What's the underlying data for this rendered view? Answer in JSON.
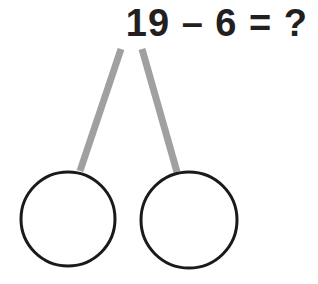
{
  "page": {
    "background_color": "#ffffff",
    "width": 318,
    "height": 284
  },
  "equation": {
    "text": "19 – 6 = ?",
    "minuend": "19",
    "operator": "–",
    "subtrahend": "6",
    "equals": "=",
    "result_placeholder": "?",
    "color": "#231f20"
  },
  "number_bond": {
    "branch_color": "#a0a0a0",
    "circle_stroke_color": "#1a1a1a",
    "circle_fill_color": "#ffffff",
    "circle_stroke_width": 3,
    "branch_width": 7,
    "apex": {
      "x": 130,
      "y": 48
    },
    "left_branch": {
      "x1": 121,
      "y1": 49,
      "x2": 80,
      "y2": 171
    },
    "right_branch": {
      "x1": 142,
      "y1": 49,
      "x2": 177,
      "y2": 172
    },
    "left_circle": {
      "cx": 68,
      "cy": 219,
      "r": 47,
      "label": ""
    },
    "right_circle": {
      "cx": 189,
      "cy": 220,
      "r": 48,
      "label": ""
    }
  }
}
